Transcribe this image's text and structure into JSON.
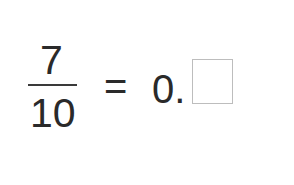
{
  "equation": {
    "numerator": "7",
    "denominator": "10",
    "equals": "=",
    "decimal_prefix": "0.",
    "answer_value": ""
  },
  "colors": {
    "text": "#2a2a2a",
    "box_border": "#bdbdbd",
    "background": "#ffffff"
  }
}
